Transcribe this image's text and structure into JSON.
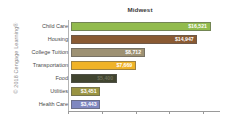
{
  "copyright": {
    "text": "© 2018 Cengage Learning®"
  },
  "chart_data": {
    "type": "bar",
    "orientation": "horizontal",
    "title": "Midwest",
    "xlabel": "",
    "ylabel": "",
    "grid": false,
    "legend": false,
    "xlim": [
      0,
      18000
    ],
    "xticks": [
      0,
      4000,
      8000,
      12000,
      16000
    ],
    "xtick_labels": [
      "",
      "",
      "",
      "",
      ""
    ],
    "categories": [
      "Child Care",
      "Housing",
      "College Tuition",
      "Transportation",
      "Food",
      "Utilities",
      "Health Care"
    ],
    "values": [
      16521,
      14947,
      8712,
      7669,
      5400,
      3451,
      3443
    ],
    "value_labels": [
      "$16,521",
      "$14,947",
      "$8,712",
      "$7,669",
      "$5,400",
      "$3,451",
      "$3,443"
    ],
    "bar_colors": [
      "#92bb4e",
      "#8a5a33",
      "#9d9173",
      "#f0b328",
      "#414530",
      "#9a9442",
      "#8088c0"
    ],
    "value_label_colors": [
      "#ffffff",
      "#ffffff",
      "#ffffff",
      "#ffffff",
      "#6e7058",
      "#ffffff",
      "#ffffff"
    ]
  }
}
